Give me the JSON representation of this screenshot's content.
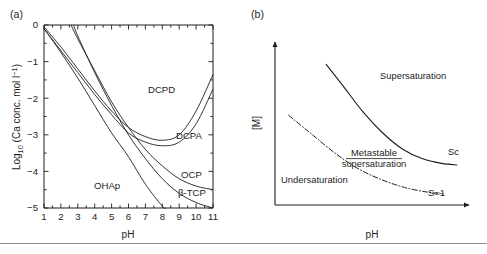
{
  "figure": {
    "panels": [
      {
        "tag": "(a)",
        "name": "solubility-isotherms",
        "xlabel": "pH",
        "ylabel_parts": {
          "main_pre": "Log",
          "main_sub": "10",
          "main_post": " (Ca conc. mol l",
          "sup": "−1",
          "close": ")"
        },
        "ylabel": "Log10 (Ca conc. mol l-1)",
        "xticks": [
          "1",
          "2",
          "3",
          "4",
          "5",
          "6",
          "7",
          "8",
          "9",
          "10",
          "11"
        ],
        "yticks": [
          "0",
          "−1",
          "−2",
          "−3",
          "−4",
          "−5"
        ],
        "curve_labels": [
          {
            "key": "dcpd",
            "text": "DCPD"
          },
          {
            "key": "dcpa",
            "text": "DCPA"
          },
          {
            "key": "ocp",
            "text": "OCP"
          },
          {
            "key": "btcp",
            "text": "β-TCP"
          },
          {
            "key": "ohap",
            "text": "OHAp"
          }
        ]
      },
      {
        "tag": "(b)",
        "name": "supersaturation-diagram",
        "xlabel": "pH",
        "ylabel": "[M]",
        "region_labels": [
          {
            "key": "supersaturation",
            "text": "Supersaturation"
          },
          {
            "key": "metastable_line1",
            "text": "Metastable"
          },
          {
            "key": "metastable_line2",
            "text": "supersaturation"
          },
          {
            "key": "undersaturation",
            "text": "Undersaturation"
          }
        ],
        "curve_labels": [
          {
            "key": "sc",
            "text": "Sc"
          },
          {
            "key": "s1",
            "text": "S=1"
          }
        ]
      }
    ]
  },
  "chart_data": [
    {
      "type": "line",
      "panel": "(a)",
      "title": "Solubility isotherms of calcium phosphate phases",
      "xlabel": "pH",
      "ylabel": "Log10 (Ca conc. mol l-1)",
      "xlim": [
        1,
        11
      ],
      "ylim": [
        -5,
        0
      ],
      "grid": false,
      "legend": "inline-curve-labels",
      "xticks": [
        1,
        2,
        3,
        4,
        5,
        6,
        7,
        8,
        9,
        10,
        11
      ],
      "yticks": [
        0,
        -1,
        -2,
        -3,
        -4,
        -5
      ],
      "minor_ticks": true,
      "series": [
        {
          "name": "DCPD",
          "x": [
            1.0,
            2.0,
            3.0,
            4.0,
            5.0,
            6.0,
            7.0,
            8.0,
            9.0,
            10.0,
            11.0
          ],
          "y": [
            -0.05,
            -0.6,
            -1.2,
            -1.8,
            -2.35,
            -2.8,
            -3.05,
            -3.15,
            -3.0,
            -2.35,
            -1.35
          ]
        },
        {
          "name": "DCPA",
          "x": [
            1.0,
            2.0,
            3.0,
            4.0,
            5.0,
            6.0,
            7.0,
            8.0,
            9.0,
            10.0,
            11.0
          ],
          "y": [
            -0.1,
            -0.7,
            -1.3,
            -1.9,
            -2.45,
            -2.95,
            -3.2,
            -3.3,
            -3.2,
            -2.7,
            -1.75
          ]
        },
        {
          "name": "OCP",
          "x": [
            2.6,
            3.0,
            4.0,
            5.0,
            6.0,
            7.0,
            8.0,
            9.0,
            10.0,
            11.0
          ],
          "y": [
            0.0,
            -0.38,
            -1.25,
            -2.1,
            -2.8,
            -3.4,
            -3.85,
            -4.2,
            -4.4,
            -4.5
          ]
        },
        {
          "name": "β-TCP",
          "x": [
            2.75,
            3.0,
            4.0,
            5.0,
            6.0,
            7.0,
            8.0,
            9.0,
            10.0,
            11.0
          ],
          "y": [
            0.0,
            -0.3,
            -1.3,
            -2.2,
            -3.0,
            -3.65,
            -4.2,
            -4.6,
            -4.85,
            -5.0
          ]
        },
        {
          "name": "OHAp",
          "x": [
            1.0,
            2.0,
            3.0,
            4.0,
            5.0,
            6.0,
            7.0,
            8.0,
            8.2
          ],
          "y": [
            -0.1,
            -0.75,
            -1.45,
            -2.2,
            -2.95,
            -3.6,
            -4.35,
            -4.95,
            -5.0
          ]
        }
      ]
    },
    {
      "type": "line",
      "panel": "(b)",
      "title": "Supersaturation regions versus pH",
      "xlabel": "pH",
      "ylabel": "[M]",
      "grid": false,
      "axis_style": "arrows",
      "annotations": [
        "Supersaturation",
        "Metastable supersaturation",
        "Undersaturation"
      ],
      "series": [
        {
          "name": "Sc",
          "style": "solid",
          "x": [
            0.26,
            0.35,
            0.45,
            0.55,
            0.65,
            0.75,
            0.85,
            0.93
          ],
          "y": [
            0.88,
            0.74,
            0.58,
            0.45,
            0.35,
            0.29,
            0.26,
            0.25
          ]
        },
        {
          "name": "S=1",
          "style": "dash-dot",
          "x": [
            0.07,
            0.18,
            0.3,
            0.42,
            0.54,
            0.66,
            0.78,
            0.86
          ],
          "y": [
            0.56,
            0.45,
            0.33,
            0.23,
            0.16,
            0.11,
            0.08,
            0.07
          ]
        }
      ]
    }
  ]
}
